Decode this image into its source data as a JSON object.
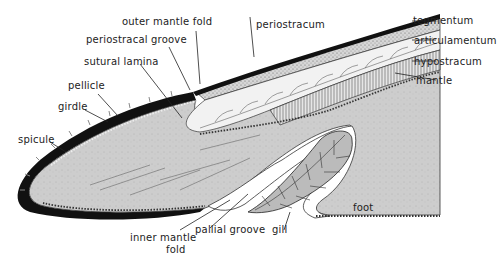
{
  "diagram": {
    "labels": {
      "outer_mantle_fold": "outer mantle fold",
      "periostracal_groove": "periostracal groove",
      "sutural_lamina": "sutural lamina",
      "pellicle": "pellicle",
      "girdle": "girdle",
      "spicule": "spicule",
      "periostracum": "periostracum",
      "tegmentum": "tegmentum",
      "articulamentum": "articulamentum",
      "hypostracum": "hypostracum",
      "mantle": "mantle",
      "inner_mantle_fold_1": "inner mantle",
      "inner_mantle_fold_2": "fold",
      "pallial_groove": "pallial groove",
      "gill": "gill",
      "foot": "foot"
    },
    "colors": {
      "girdle_black": "#111111",
      "tissue_gray": "#cfcfcf",
      "stipple": "#bdbdbd",
      "line": "#222222",
      "background": "#ffffff"
    }
  }
}
